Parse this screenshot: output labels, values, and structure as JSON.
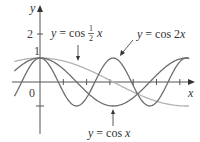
{
  "chart_data": {
    "type": "line",
    "title": "",
    "xlabel": "x",
    "ylabel": "y",
    "xlim": [
      -1.1,
      6.6
    ],
    "ylim": [
      -2.2,
      3.4
    ],
    "grid": false,
    "legend_position": "inline annotations with arrows",
    "y_ticks": [
      {
        "value": 2,
        "label": "2"
      },
      {
        "value": 1,
        "label": "1"
      },
      {
        "value": -1,
        "label": ""
      }
    ],
    "x_ticks": [
      1,
      2,
      3,
      4,
      5,
      6
    ],
    "origin_label": "0",
    "series": [
      {
        "name": "y = cos ½x",
        "function": "cos(0.5*x)",
        "color": "#b3b3b3",
        "x_range": [
          -1.1,
          6.4
        ]
      },
      {
        "name": "y = cos x",
        "function": "cos(x)",
        "color": "#6e6e6e",
        "x_range": [
          -1.1,
          6.4
        ]
      },
      {
        "name": "y = cos 2x",
        "function": "cos(2*x)",
        "color": "#6e6e6e",
        "x_range": [
          -1.1,
          6.4
        ]
      }
    ],
    "annotations": [
      {
        "text_prefix": "y = cos",
        "fraction": "1/2",
        "suffix": "x",
        "points_to_series": "y = cos ½x"
      },
      {
        "text": "y = cos 2x",
        "points_to_series": "y = cos 2x"
      },
      {
        "text": "y = cos x",
        "points_to_series": "y = cos x"
      }
    ]
  },
  "labels": {
    "y_axis": "y",
    "x_axis": "x",
    "origin": "0",
    "tick_2": "2",
    "tick_1": "1",
    "half_label_eq": "y = cos",
    "half_num": "1",
    "half_den": "2",
    "half_var": "x",
    "cos2x": "y = cos 2x",
    "cosx": "y = cos x"
  }
}
